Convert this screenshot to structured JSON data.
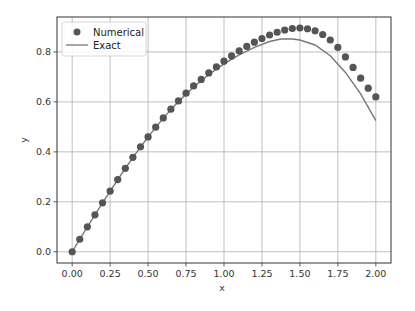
{
  "chart_data": {
    "type": "line",
    "title": "",
    "xlabel": "x",
    "ylabel": "y",
    "xlim": [
      -0.1,
      2.1
    ],
    "ylim": [
      -0.045,
      0.94
    ],
    "grid": true,
    "legend": {
      "placement": "top-left",
      "entries": [
        "Numerical",
        "Exact"
      ]
    },
    "x_ticks": [
      0.0,
      0.25,
      0.5,
      0.75,
      1.0,
      1.25,
      1.5,
      1.75,
      2.0
    ],
    "x_tick_labels": [
      "0.00",
      "0.25",
      "0.50",
      "0.75",
      "1.00",
      "1.25",
      "1.50",
      "1.75",
      "2.00"
    ],
    "y_ticks": [
      0.0,
      0.2,
      0.4,
      0.6,
      0.8
    ],
    "y_tick_labels": [
      "0.0",
      "0.2",
      "0.4",
      "0.6",
      "0.8"
    ],
    "series": [
      {
        "name": "Numerical",
        "style": "markers",
        "color": "#555555",
        "x": [
          0.0,
          0.05,
          0.1,
          0.15,
          0.2,
          0.25,
          0.3,
          0.35,
          0.4,
          0.45,
          0.5,
          0.55,
          0.6,
          0.65,
          0.7,
          0.75,
          0.8,
          0.85,
          0.9,
          0.95,
          1.0,
          1.05,
          1.1,
          1.15,
          1.2,
          1.25,
          1.3,
          1.35,
          1.4,
          1.45,
          1.5,
          1.55,
          1.6,
          1.65,
          1.7,
          1.75,
          1.8,
          1.85,
          1.9,
          1.95,
          2.0
        ],
        "y": [
          0.0,
          0.05,
          0.1,
          0.148,
          0.196,
          0.243,
          0.289,
          0.334,
          0.378,
          0.42,
          0.46,
          0.499,
          0.536,
          0.571,
          0.604,
          0.635,
          0.664,
          0.69,
          0.716,
          0.74,
          0.763,
          0.784,
          0.804,
          0.822,
          0.839,
          0.854,
          0.868,
          0.879,
          0.888,
          0.894,
          0.896,
          0.893,
          0.885,
          0.87,
          0.848,
          0.818,
          0.78,
          0.738,
          0.695,
          0.655,
          0.62
        ]
      },
      {
        "name": "Exact",
        "style": "line",
        "color": "#777777",
        "x": [
          0.0,
          0.1,
          0.2,
          0.3,
          0.4,
          0.5,
          0.6,
          0.7,
          0.8,
          0.9,
          1.0,
          1.1,
          1.2,
          1.3,
          1.375,
          1.45,
          1.5,
          1.6,
          1.7,
          1.8,
          1.9,
          2.0
        ],
        "y": [
          0.0,
          0.1,
          0.196,
          0.289,
          0.378,
          0.46,
          0.535,
          0.602,
          0.66,
          0.71,
          0.752,
          0.788,
          0.818,
          0.842,
          0.852,
          0.852,
          0.848,
          0.828,
          0.785,
          0.718,
          0.632,
          0.525
        ]
      }
    ]
  }
}
